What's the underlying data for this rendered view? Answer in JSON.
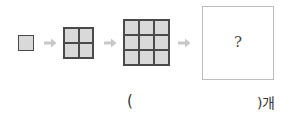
{
  "figure": {
    "sequence": [
      {
        "label": "1x1 square",
        "grid": 1
      },
      {
        "label": "2x2 square",
        "grid": 2
      },
      {
        "label": "3x3 square",
        "grid": 3
      }
    ],
    "unknown_mark": "?",
    "arrow_color": "#c8c8c8",
    "square_fill": "#d9d9d9",
    "square_border": "#4a4a4a"
  },
  "answer": {
    "open_paren": "(",
    "close_paren_unit": ")개",
    "value": ""
  }
}
